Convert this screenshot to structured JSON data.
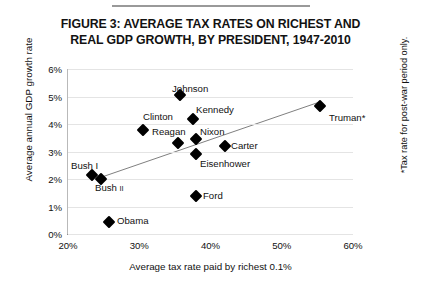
{
  "figure": {
    "title_line1": "FIGURE 3: AVERAGE TAX RATES ON RICHEST AND",
    "title_line2": "REAL GDP GROWTH, BY PRESIDENT, 1947-2010",
    "side_note": "*Tax rate for post-war period only."
  },
  "chart_data": {
    "type": "scatter",
    "title": "FIGURE 3: AVERAGE TAX RATES ON RICHEST AND REAL GDP GROWTH, BY PRESIDENT, 1947-2010",
    "xlabel": "Average tax rate paid by richest 0.1%",
    "ylabel": "Average annual GDP growth rate",
    "xlim": [
      20,
      60
    ],
    "ylim": [
      0,
      6
    ],
    "xticks": [
      "20%",
      "30%",
      "40%",
      "50%",
      "60%"
    ],
    "yticks": [
      "0%",
      "1%",
      "2%",
      "3%",
      "4%",
      "5%",
      "6%"
    ],
    "grid": true,
    "legend": "none",
    "points": [
      {
        "label": "Johnson",
        "x": 35.7,
        "y": 5.05,
        "lx": 172,
        "ly": 83,
        "anchor": "center"
      },
      {
        "label": "Kennedy",
        "x": 37.5,
        "y": 4.2,
        "lx": 196,
        "ly": 104,
        "anchor": "left"
      },
      {
        "label": "Clinton",
        "x": 35.4,
        "y": 3.3,
        "lx": 143,
        "ly": 111,
        "anchor": "left"
      },
      {
        "label": "Reagan",
        "x": 30.5,
        "y": 3.8,
        "lx": 152,
        "ly": 126,
        "anchor": "left"
      },
      {
        "label": "Nixon",
        "x": 37.9,
        "y": 3.45,
        "lx": 200,
        "ly": 126,
        "anchor": "left"
      },
      {
        "label": "Carter",
        "x": 42.0,
        "y": 3.2,
        "lx": 231,
        "ly": 140,
        "anchor": "left"
      },
      {
        "label": "Eisenhower",
        "x": 37.9,
        "y": 2.9,
        "lx": 200,
        "ly": 158,
        "anchor": "left"
      },
      {
        "label": "Bush I",
        "x": 23.4,
        "y": 2.15,
        "lx": 71,
        "ly": 160,
        "anchor": "left"
      },
      {
        "label": "Bush II",
        "x": 24.7,
        "y": 2.0,
        "lx": 95,
        "ly": 182,
        "anchor": "left",
        "sub": "II"
      },
      {
        "label": "Ford",
        "x": 37.9,
        "y": 1.4,
        "lx": 203,
        "ly": 190,
        "anchor": "left"
      },
      {
        "label": "Obama",
        "x": 25.7,
        "y": 0.45,
        "lx": 117,
        "ly": 215,
        "anchor": "left"
      },
      {
        "label": "Truman*",
        "x": 55.3,
        "y": 4.65,
        "lx": 329,
        "ly": 112,
        "anchor": "left"
      }
    ],
    "trendline": {
      "x0": 24.5,
      "y0": 2.05,
      "x1": 55.3,
      "y1": 4.8
    }
  },
  "colors": {
    "marker": "#000000",
    "gridline": "#e4e4e4",
    "trendline": "#808080",
    "text": "#111111",
    "rule": "#999999"
  }
}
